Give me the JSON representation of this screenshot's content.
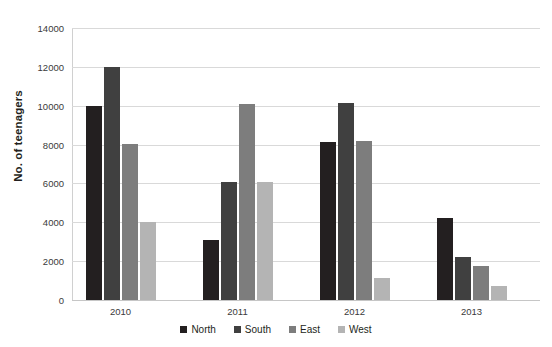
{
  "chart_data": {
    "type": "bar",
    "title": "",
    "xlabel": "",
    "ylabel": "No. of teenagers",
    "categories": [
      "2010",
      "2011",
      "2012",
      "2013"
    ],
    "series": [
      {
        "name": "North",
        "color": "#231f20",
        "values": [
          10000,
          3100,
          8150,
          4200
        ]
      },
      {
        "name": "South",
        "color": "#404040",
        "values": [
          12000,
          6100,
          10150,
          2200
        ]
      },
      {
        "name": "East",
        "color": "#7d7d7d",
        "values": [
          8050,
          10100,
          8200,
          1750
        ]
      },
      {
        "name": "West",
        "color": "#b4b4b4",
        "values": [
          4000,
          6100,
          1150,
          700
        ]
      }
    ],
    "ylim": [
      0,
      14000
    ],
    "ytick_values": [
      0,
      2000,
      4000,
      6000,
      8000,
      10000,
      12000,
      14000
    ],
    "ytick_labels": [
      "0",
      "2000",
      "4000",
      "6000",
      "8000",
      "10000",
      "12000",
      "14000"
    ],
    "grid": true,
    "legend_position": "bottom"
  },
  "legend": {
    "items": [
      {
        "label": "North"
      },
      {
        "label": "South"
      },
      {
        "label": "East"
      },
      {
        "label": "West"
      }
    ]
  }
}
